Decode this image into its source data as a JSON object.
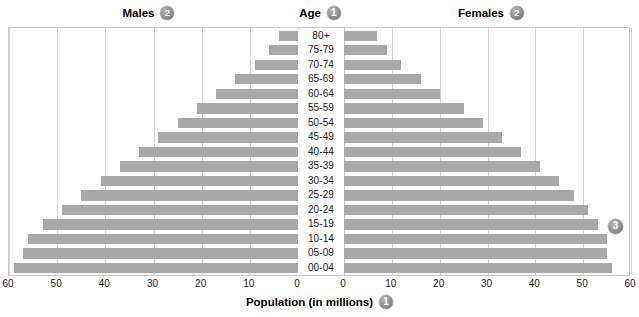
{
  "header": {
    "males_label": "Males",
    "males_badge": "2",
    "age_label": "Age",
    "age_badge": "1",
    "females_label": "Females",
    "females_badge": "2"
  },
  "annotations": {
    "badge_3": "3"
  },
  "axis_title": {
    "text": "Population (in millions)",
    "badge": "1"
  },
  "colors": {
    "bar": "#a9a9a9",
    "gridline": "#d5d5d5",
    "frame": "#c9c9c9",
    "text": "#1a1a1a",
    "badge": "#8d8d8d"
  },
  "chart_data": {
    "type": "bar",
    "subtype": "population-pyramid",
    "title": "",
    "xlabel": "Population (in millions)",
    "ylabel": "Age",
    "grid": true,
    "legend_position": "top",
    "axis_max": 60,
    "xticks_left": [
      "60",
      "50",
      "40",
      "30",
      "20",
      "10",
      "0"
    ],
    "xticks_right": [
      "0",
      "10",
      "20",
      "30",
      "40",
      "50",
      "60"
    ],
    "categories": [
      "80+",
      "75-79",
      "70-74",
      "65-69",
      "60-64",
      "55-59",
      "50-54",
      "45-49",
      "40-44",
      "35-39",
      "30-34",
      "25-29",
      "20-24",
      "15-19",
      "10-14",
      "05-09",
      "00-04"
    ],
    "series": [
      {
        "name": "Males",
        "side": "left",
        "values": [
          4,
          6,
          9,
          13,
          17,
          21,
          25,
          29,
          33,
          37,
          41,
          45,
          49,
          53,
          56,
          57,
          59
        ]
      },
      {
        "name": "Females",
        "side": "right",
        "values": [
          7,
          9,
          12,
          16,
          20,
          25,
          29,
          33,
          37,
          41,
          45,
          48,
          51,
          53,
          55,
          55,
          56
        ]
      }
    ]
  }
}
